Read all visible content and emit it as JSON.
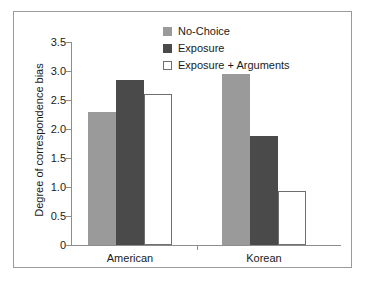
{
  "chart_data": {
    "type": "bar",
    "title": "",
    "xlabel": "",
    "ylabel": "Degree of correspondence bias",
    "categories": [
      "American",
      "Korean"
    ],
    "series": [
      {
        "name": "No-Choice",
        "color": "#9a9a9a",
        "values": [
          2.3,
          2.94
        ]
      },
      {
        "name": "Exposure",
        "color": "#4a4a4a",
        "values": [
          2.85,
          1.88
        ]
      },
      {
        "name": "Exposure + Arguments",
        "color": "#ffffff",
        "values": [
          2.6,
          0.93
        ]
      }
    ],
    "ylim": [
      0,
      3.5
    ],
    "ytick_labels": [
      "3.5",
      "3.0",
      "2.5",
      "2.0",
      "1.5",
      "1.0",
      "0.5",
      "0"
    ],
    "ytick_values": [
      3.5,
      3.0,
      2.5,
      2.0,
      1.5,
      1.0,
      0.5,
      0
    ],
    "grid": false,
    "legend_position": "top-center"
  },
  "legend": {
    "entries": [
      {
        "label": "No-Choice"
      },
      {
        "label": "Exposure"
      },
      {
        "label": "Exposure + Arguments"
      }
    ]
  }
}
